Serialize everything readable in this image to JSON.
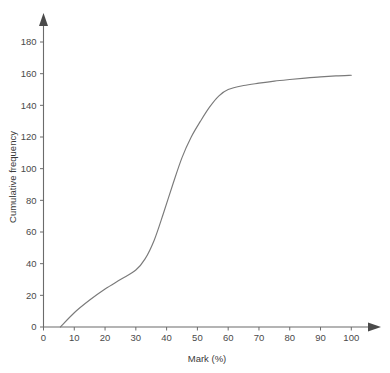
{
  "chart_data": {
    "type": "line",
    "title": "",
    "xlabel": "Mark (%)",
    "ylabel": "Cumulative frequency",
    "xlim": [
      0,
      100
    ],
    "ylim": [
      0,
      180
    ],
    "grid": false,
    "legend": null,
    "x_ticks": [
      0,
      10,
      20,
      30,
      40,
      50,
      60,
      70,
      80,
      90,
      100
    ],
    "y_ticks": [
      0,
      20,
      40,
      60,
      80,
      100,
      120,
      140,
      160,
      180
    ],
    "x_tick_labels": [
      "0",
      "10",
      "20",
      "30",
      "40",
      "50",
      "60",
      "70",
      "80",
      "90",
      "100"
    ],
    "y_tick_labels": [
      "0",
      "20",
      "40",
      "60",
      "80",
      "100",
      "120",
      "140",
      "160",
      "180"
    ],
    "series": [
      {
        "name": "Cumulative frequency",
        "color": "#7a7a7a",
        "x": [
          5.5,
          10,
          15,
          20,
          25,
          30,
          33,
          36,
          39,
          42,
          45,
          48,
          51,
          54,
          57,
          60,
          65,
          70,
          75,
          80,
          85,
          90,
          95,
          100
        ],
        "y": [
          0,
          9,
          17,
          24,
          30,
          36,
          43,
          55,
          72,
          90,
          107,
          120,
          130,
          139,
          146,
          150,
          152.5,
          154,
          155.3,
          156.3,
          157.2,
          158,
          158.6,
          159
        ]
      }
    ]
  },
  "axes": {
    "x_axis_name": "x-axis",
    "y_axis_name": "y-axis",
    "has_arrowheads": true,
    "axis_color": "#6b6b6b"
  }
}
